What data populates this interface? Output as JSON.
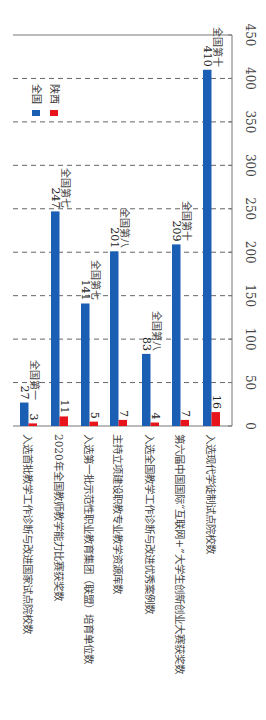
{
  "chart_data": {
    "type": "bar",
    "orientation": "rotated-90-clockwise",
    "title": "",
    "xlabel": "",
    "ylabel": "",
    "ylim": [
      0,
      450
    ],
    "yticks": [
      0,
      50,
      100,
      150,
      200,
      250,
      300,
      350,
      400,
      450
    ],
    "grid": "dashed, every 50",
    "legend_position": "upper-left (in rotated view)",
    "categories": [
      "入选首批教学工作诊断与改进国家试点院校数",
      "2020年全国教师教学能力比赛获奖数",
      "入选第一批示范性职业教育集团（联盟）培育单位数",
      "主持立项建设职教专业教学资源库数",
      "入选全国教学工作诊断与改进优秀案例数",
      "第六届中国国际“互联网+”大学生创新创业大赛获奖数",
      "入选现代学徒制试点院校数"
    ],
    "series": [
      {
        "name": "全国",
        "color": "#1a5fb4",
        "values": [
          27,
          247,
          141,
          201,
          83,
          209,
          410
        ]
      },
      {
        "name": "陕西",
        "color": "#e8141c",
        "values": [
          3,
          11,
          5,
          7,
          4,
          7,
          16
        ]
      }
    ],
    "annotations": [
      "全国第一",
      "全国第七",
      "全国第七",
      "全国第八",
      "全国第八",
      "全国第十",
      "全国第十"
    ]
  },
  "legend": {
    "items": [
      {
        "label": "全国",
        "color": "#1a5fb4"
      },
      {
        "label": "陕西",
        "color": "#e8141c"
      }
    ]
  }
}
